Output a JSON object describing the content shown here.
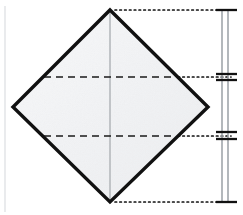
{
  "figure": {
    "canvas": {
      "width": 243,
      "height": 215,
      "background": "#ffffff"
    },
    "colors": {
      "outline": "#111111",
      "paper_fill": "#f4f5f6",
      "crease_dashed": "#1a1a1a",
      "center_line": "#b9bcc0",
      "projection_dotted": "#111111",
      "dimension_rule": "#9aa0a6",
      "dimension_tick": "#111111",
      "margin_guide": "#d8dade"
    },
    "shape": {
      "name": "diamond",
      "description": "square rotated 45 degrees",
      "vertices": {
        "top": {
          "x": 110,
          "y": 10
        },
        "right": {
          "x": 208,
          "y": 107
        },
        "bottom": {
          "x": 110,
          "y": 202
        },
        "left": {
          "x": 13,
          "y": 107
        }
      },
      "outline_width": 3.4,
      "fill": "#f4f5f6"
    },
    "center_line": {
      "name": "vertical-center-crease",
      "x": 110,
      "y_start": 10,
      "y_end": 202,
      "stroke": "#b9bcc0",
      "width": 1.6,
      "style": "solid"
    },
    "crease_lines": [
      {
        "name": "upper-fold-crease",
        "y": 77,
        "x_start": 42,
        "x_end": 177,
        "style": "dashed",
        "dash": "7,5",
        "width": 1.5
      },
      {
        "name": "lower-fold-crease",
        "y": 136,
        "x_start": 42,
        "x_end": 177,
        "style": "dashed",
        "dash": "7,5",
        "width": 1.5
      }
    ],
    "projection_lines": [
      {
        "name": "top-vertex-projection",
        "y": 10,
        "x_start": 114,
        "x_end": 231,
        "style": "dotted"
      },
      {
        "name": "upper-crease-projection",
        "y": 77,
        "x_start": 178,
        "x_end": 231,
        "style": "dotted"
      },
      {
        "name": "lower-crease-projection",
        "y": 136,
        "x_start": 178,
        "x_end": 231,
        "style": "dotted"
      },
      {
        "name": "bottom-vertex-projection",
        "y": 202,
        "x_start": 114,
        "x_end": 231,
        "style": "dotted"
      }
    ],
    "dimension_ladder": {
      "name": "vertical-dimension-ladder",
      "rule_x_left": 222,
      "rule_x_right": 228,
      "y_top": 10,
      "y_bottom": 202,
      "rule_stroke": "#9aa0a6",
      "rule_width": 1.4,
      "ticks": [
        {
          "name": "tick-top",
          "y": 10,
          "x_start": 216,
          "x_end": 236,
          "width": 2.2
        },
        {
          "name": "tick-upper-above",
          "y": 74,
          "x_start": 216,
          "x_end": 236,
          "width": 2.2
        },
        {
          "name": "tick-upper-below",
          "y": 80,
          "x_start": 216,
          "x_end": 236,
          "width": 2.2
        },
        {
          "name": "tick-lower-above",
          "y": 132,
          "x_start": 216,
          "x_end": 236,
          "width": 2.2
        },
        {
          "name": "tick-lower-below",
          "y": 139,
          "x_start": 216,
          "x_end": 236,
          "width": 2.2
        },
        {
          "name": "tick-bottom",
          "y": 202,
          "x_start": 216,
          "x_end": 236,
          "width": 2.2
        }
      ],
      "segments": [
        {
          "name": "segment-top",
          "from_y": 10,
          "to_y": 74,
          "height_px": 64
        },
        {
          "name": "segment-middle",
          "from_y": 80,
          "to_y": 132,
          "height_px": 52
        },
        {
          "name": "segment-bottom",
          "from_y": 139,
          "to_y": 202,
          "height_px": 63
        }
      ]
    },
    "margin_guide": {
      "name": "left-margin-guide",
      "x": 5,
      "y_start": 6,
      "y_end": 212,
      "stroke": "#d8dade",
      "width": 1.1
    },
    "labels": []
  }
}
